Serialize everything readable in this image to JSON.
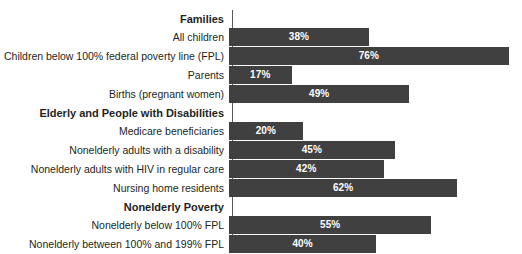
{
  "chart_data": {
    "type": "bar",
    "title": "",
    "subtitle": "",
    "xlabel": "",
    "ylabel": "",
    "orientation": "horizontal",
    "xlim": [
      0,
      80
    ],
    "grid": false,
    "legend": null,
    "value_suffix": "%",
    "bar_color": "#404040",
    "axis_color": "#58595b",
    "text_color": "#231f20",
    "value_text_color": "#ffffff",
    "rows": [
      {
        "kind": "group",
        "label": "Families",
        "value": null,
        "value_label": ""
      },
      {
        "kind": "bar",
        "label": "All children",
        "value": 38,
        "value_label": "38%"
      },
      {
        "kind": "bar",
        "label": "Children below 100% federal poverty line (FPL)",
        "value": 76,
        "value_label": "76%"
      },
      {
        "kind": "bar",
        "label": "Parents",
        "value": 17,
        "value_label": "17%"
      },
      {
        "kind": "bar",
        "label": "Births (pregnant women)",
        "value": 49,
        "value_label": "49%"
      },
      {
        "kind": "group",
        "label": "Elderly and People with Disabilities",
        "value": null,
        "value_label": ""
      },
      {
        "kind": "bar",
        "label": "Medicare beneficiaries",
        "value": 20,
        "value_label": "20%"
      },
      {
        "kind": "bar",
        "label": "Nonelderly adults with a disability",
        "value": 45,
        "value_label": "45%"
      },
      {
        "kind": "bar",
        "label": "Nonelderly adults with HIV in regular care",
        "value": 42,
        "value_label": "42%"
      },
      {
        "kind": "bar",
        "label": "Nursing home residents",
        "value": 62,
        "value_label": "62%"
      },
      {
        "kind": "group",
        "label": "Nonelderly Poverty",
        "value": null,
        "value_label": ""
      },
      {
        "kind": "bar",
        "label": "Nonelderly below 100% FPL",
        "value": 55,
        "value_label": "55%"
      },
      {
        "kind": "bar",
        "label": "Nonelderly between 100% and 199% FPL",
        "value": 40,
        "value_label": "40%"
      }
    ],
    "categories": [
      "All children",
      "Children below 100% federal poverty line (FPL)",
      "Parents",
      "Births (pregnant women)",
      "Medicare beneficiaries",
      "Nonelderly adults with a disability",
      "Nonelderly adults with HIV in regular care",
      "Nursing home residents",
      "Nonelderly below 100% FPL",
      "Nonelderly between 100% and 199% FPL"
    ],
    "values": [
      38,
      76,
      17,
      49,
      20,
      45,
      42,
      62,
      55,
      40
    ],
    "groups": [
      "Families",
      "Elderly and People with Disabilities",
      "Nonelderly Poverty"
    ]
  }
}
